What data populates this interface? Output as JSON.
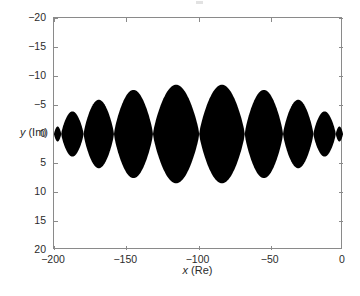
{
  "figure": {
    "background": "#ffffff",
    "axis_color": "#8a8a8a",
    "text_color": "#2b2b2b"
  },
  "axes": {
    "x_title_var": "x",
    "x_title_unit": " (Re)",
    "y_title_var": "y",
    "y_title_unit": " (Im)",
    "x_ticks": [
      {
        "value": -200,
        "label": "−200"
      },
      {
        "value": -150,
        "label": "−150"
      },
      {
        "value": -100,
        "label": "−100"
      },
      {
        "value": -50,
        "label": "−50"
      },
      {
        "value": 0,
        "label": "0"
      }
    ],
    "y_ticks": [
      {
        "value": -20,
        "label": "−20"
      },
      {
        "value": -15,
        "label": "−15"
      },
      {
        "value": -10,
        "label": "−10"
      },
      {
        "value": -5,
        "label": "−5"
      },
      {
        "value": 0,
        "label": "0"
      },
      {
        "value": 5,
        "label": "5"
      },
      {
        "value": 10,
        "label": "10"
      },
      {
        "value": 15,
        "label": "15"
      },
      {
        "value": 20,
        "label": "20"
      }
    ]
  },
  "chart_data": {
    "type": "area",
    "title": "",
    "xlabel": "x (Re)",
    "ylabel": "y (Im)",
    "xlim": [
      -200,
      0
    ],
    "ylim": [
      -20,
      20
    ],
    "y_axis_inverted": true,
    "grid": false,
    "legend": null,
    "fill_color": "#000000",
    "lobes": [
      {
        "x_start": -200.0,
        "x_end": -195.0,
        "x_center": -197.5,
        "half_height": 1.3
      },
      {
        "x_start": -195.0,
        "x_end": -179.5,
        "x_center": -187.2,
        "half_height": 3.9
      },
      {
        "x_start": -179.5,
        "x_end": -158.5,
        "x_center": -169.0,
        "half_height": 5.9
      },
      {
        "x_start": -158.5,
        "x_end": -131.5,
        "x_center": -145.0,
        "half_height": 7.6
      },
      {
        "x_start": -131.5,
        "x_end": -99.5,
        "x_center": -115.5,
        "half_height": 8.5
      },
      {
        "x_start": -99.5,
        "x_end": -68.0,
        "x_center": -83.5,
        "half_height": 8.5
      },
      {
        "x_start": -68.0,
        "x_end": -41.5,
        "x_center": -54.5,
        "half_height": 7.6
      },
      {
        "x_start": -41.5,
        "x_end": -20.5,
        "x_center": -31.0,
        "half_height": 5.9
      },
      {
        "x_start": -20.5,
        "x_end": -5.0,
        "x_center": -12.5,
        "half_height": 3.9
      },
      {
        "x_start": -5.0,
        "x_end": 0.0,
        "x_center": -2.5,
        "half_height": 1.3
      }
    ],
    "series": [
      {
        "name": "upper envelope (y, Im)",
        "x": [
          -200,
          -197.5,
          -195,
          -187.2,
          -179.5,
          -169,
          -158.5,
          -145,
          -131.5,
          -115.5,
          -99.5,
          -83.5,
          -68,
          -54.5,
          -41.5,
          -31,
          -20.5,
          -12.5,
          -5,
          -2.5,
          0
        ],
        "values": [
          0,
          -1.3,
          0,
          -3.9,
          0,
          -5.9,
          0,
          -7.6,
          0,
          -8.5,
          0,
          -8.5,
          0,
          -7.6,
          0,
          -5.9,
          0,
          -3.9,
          0,
          -1.3,
          0
        ]
      },
      {
        "name": "lower envelope (y, Im)",
        "x": [
          -200,
          -197.5,
          -195,
          -187.2,
          -179.5,
          -169,
          -158.5,
          -145,
          -131.5,
          -115.5,
          -99.5,
          -83.5,
          -68,
          -54.5,
          -41.5,
          -31,
          -20.5,
          -12.5,
          -5,
          -2.5,
          0
        ],
        "values": [
          0,
          1.3,
          0,
          3.9,
          0,
          5.9,
          0,
          7.6,
          0,
          8.5,
          0,
          8.5,
          0,
          7.6,
          0,
          5.9,
          0,
          3.9,
          0,
          1.3,
          0
        ]
      }
    ]
  }
}
